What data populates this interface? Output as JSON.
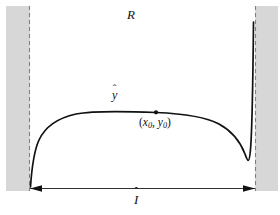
{
  "figure": {
    "title_label": "R",
    "curve_label_base": "y",
    "curve_label_hat": "ˆ",
    "interval_label_base": "I",
    "interval_label_hat": "ˆ",
    "point_label": {
      "open_paren": "(",
      "x_var": "x",
      "x_sub": "0",
      "comma": ", ",
      "y_var": "y",
      "y_sub": "0",
      "close_paren": ")"
    },
    "colors": {
      "background": "#ffffff",
      "band_fill": "#d7d7d7",
      "curve_stroke": "#111111",
      "dashed_stroke": "#808080",
      "axis_stroke": "#333333",
      "text": "#111111"
    },
    "geometry": {
      "left_band": {
        "x": 6,
        "y": 6,
        "width": 24,
        "height": 185
      },
      "right_band": {
        "x": 255,
        "y": 6,
        "width": 23,
        "height": 185
      },
      "left_dashed_x": 29.5,
      "right_dashed_x": 255.5,
      "dashed_y_top": 6,
      "dashed_y_bottom": 191,
      "interval_line_y": 188,
      "interval_line_x_start": 30,
      "interval_line_x_end": 255,
      "marked_point": {
        "x": 156,
        "y": 112.5
      },
      "curve_start": {
        "x": 30,
        "y": 186
      },
      "curve_end": {
        "x": 254,
        "y": 22
      }
    },
    "curve_path": "M 30,186 C 33,160 38,142 46,131 C 56,118 72,113 92,111.5 C 112,110 134,111 156,112.5 C 178,114 196,117 212,122 C 228,127 240,136 246,150 C 251,162 253,176 254,22"
  }
}
